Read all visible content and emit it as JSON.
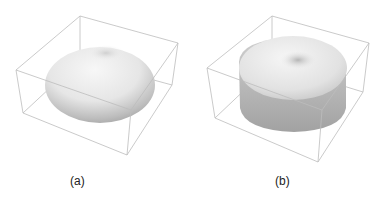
{
  "figure": {
    "panels": [
      {
        "id": "a",
        "label": "(a)",
        "shape": "torus-like surface (flattened sphere with top dimple)",
        "bounding_box": "wireframe cube"
      },
      {
        "id": "b",
        "label": "(b)",
        "shape": "torus-like surface with cylindrical sides",
        "bounding_box": "wireframe cube"
      }
    ]
  },
  "colors": {
    "box_edge": "#b8b8b8",
    "surface_light": "#f4f4f4",
    "surface_shadow": "#9a9a9a"
  }
}
